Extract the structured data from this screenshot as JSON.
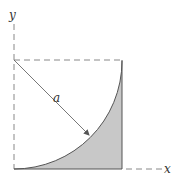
{
  "diagram": {
    "labels": {
      "y_axis": "y",
      "x_axis": "x",
      "radius": "a"
    },
    "colors": {
      "shade": "#c8c8c8",
      "line": "#555555",
      "dash": "#888888"
    },
    "geometry": {
      "origin": [
        14,
        169
      ],
      "square_size": 108,
      "arc_center": [
        14,
        60
      ],
      "radius": 108
    }
  }
}
